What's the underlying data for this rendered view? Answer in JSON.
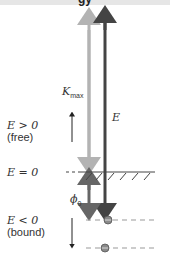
{
  "header": {
    "title_fragment": "gy"
  },
  "labels": {
    "kmax": "K",
    "kmax_sub": "max",
    "E": "E",
    "e_positive": "E > 0",
    "free": "(free)",
    "e_zero": "E = 0",
    "phi": "ϕ",
    "phi_sub": "0",
    "e_negative": "E < 0",
    "bound": "(bound)"
  },
  "colors": {
    "light_arrow": "#b3b3b3",
    "dark_arrow": "#444444",
    "phi_arrow": "#666666",
    "electron": "#8a8a8a",
    "dash": "#999999"
  }
}
